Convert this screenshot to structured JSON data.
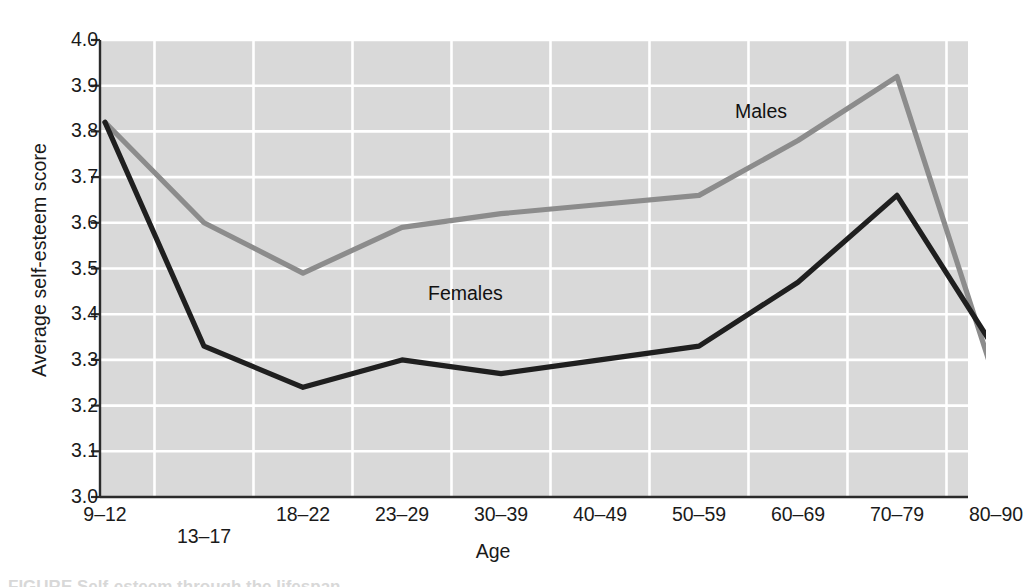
{
  "chart_data": {
    "type": "line",
    "title": "",
    "xlabel": "Age",
    "ylabel": "Average self-esteem score",
    "categories": [
      "9–12",
      "13–17",
      "18–22",
      "23–29",
      "30–39",
      "40–49",
      "50–59",
      "60–69",
      "70–79",
      "80–90"
    ],
    "ylim": [
      3.0,
      4.0
    ],
    "yticks": [
      "3.0",
      "3.1",
      "3.2",
      "3.3",
      "3.4",
      "3.5",
      "3.6",
      "3.7",
      "3.8",
      "3.9",
      "4.0"
    ],
    "ytick_values": [
      3.0,
      3.1,
      3.2,
      3.3,
      3.4,
      3.5,
      3.6,
      3.7,
      3.8,
      3.9,
      4.0
    ],
    "grid": true,
    "legend_position": "inline-annotation",
    "series": [
      {
        "name": "Males",
        "color": "#8c8c8c",
        "values": [
          3.82,
          3.6,
          3.49,
          3.59,
          3.62,
          3.64,
          3.66,
          3.78,
          3.92,
          3.25
        ]
      },
      {
        "name": "Females",
        "color": "#1f1f1f",
        "values": [
          3.82,
          3.33,
          3.24,
          3.3,
          3.27,
          3.3,
          3.33,
          3.47,
          3.66,
          3.32
        ]
      }
    ],
    "annotations": [
      {
        "text": "Males",
        "series": "Males"
      },
      {
        "text": "Females",
        "series": "Females"
      }
    ]
  },
  "figure": {
    "plot_bg": "#d9d9d9",
    "grid_color": "#ffffff",
    "axis_color": "#2b2b2b",
    "caption_partial": "FIGURE  Self-esteem through the lifespan."
  }
}
